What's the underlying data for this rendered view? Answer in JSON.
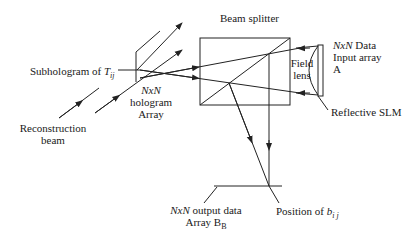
{
  "diagram": {
    "type": "optical-setup",
    "labels": {
      "beam_splitter": "Beam splitter",
      "subhologram_prefix": "Subhologram of ",
      "subhologram_var": "T",
      "subhologram_sub": "ij",
      "reconstruction_line1": "Reconstruction",
      "reconstruction_line2": "beam",
      "hologram_line1": "NxN",
      "hologram_line2": "hologram",
      "hologram_line3": "Array",
      "field_line1": "Field",
      "field_line2": "lens",
      "input_line1_var": "NxN",
      "input_line1_rest": " Data",
      "input_line2": "Input array",
      "input_line3": "A",
      "reflective_slm": "Reflective SLM",
      "output_line1_var": "NxN",
      "output_line1_rest": " output data",
      "output_line2_prefix": "Array B",
      "output_line2_sub": "B",
      "position_prefix": "Position of ",
      "position_var": "b",
      "position_sub": "i j"
    },
    "colors": {
      "line": "#222222",
      "background": "#ffffff"
    }
  }
}
